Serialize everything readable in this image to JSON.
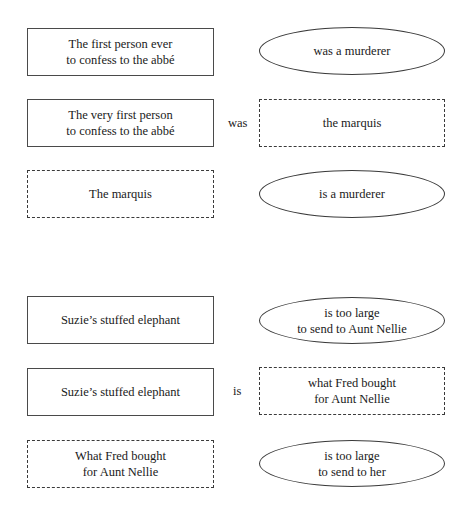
{
  "diagram": {
    "groups": [
      {
        "rows": [
          {
            "left": {
              "shape": "solid-rectangle",
              "text": "The first person ever\nto confess to the abbé"
            },
            "copula": "",
            "right": {
              "shape": "ellipse",
              "text": "was a murderer"
            }
          },
          {
            "left": {
              "shape": "solid-rectangle",
              "text": "The very first person\nto confess to the abbé"
            },
            "copula": "was",
            "right": {
              "shape": "dashed-rectangle",
              "text": "the marquis"
            }
          },
          {
            "left": {
              "shape": "dashed-rectangle",
              "text": "The marquis"
            },
            "copula": "",
            "right": {
              "shape": "ellipse",
              "text": "is a murderer"
            }
          }
        ]
      },
      {
        "rows": [
          {
            "left": {
              "shape": "solid-rectangle",
              "text": "Suzie’s stuffed elephant"
            },
            "copula": "",
            "right": {
              "shape": "ellipse",
              "text": "is too large\nto send to Aunt Nellie"
            }
          },
          {
            "left": {
              "shape": "solid-rectangle",
              "text": "Suzie’s stuffed elephant"
            },
            "copula": "is",
            "right": {
              "shape": "dashed-rectangle",
              "text": "what Fred bought\nfor Aunt Nellie"
            }
          },
          {
            "left": {
              "shape": "dashed-rectangle",
              "text": "What Fred bought\nfor Aunt Nellie"
            },
            "copula": "",
            "right": {
              "shape": "ellipse",
              "text": "is too large\nto send to her"
            }
          }
        ]
      }
    ],
    "colors": {
      "line": "#3a3a3a",
      "text": "#1a1a1a",
      "background": "#ffffff"
    }
  }
}
